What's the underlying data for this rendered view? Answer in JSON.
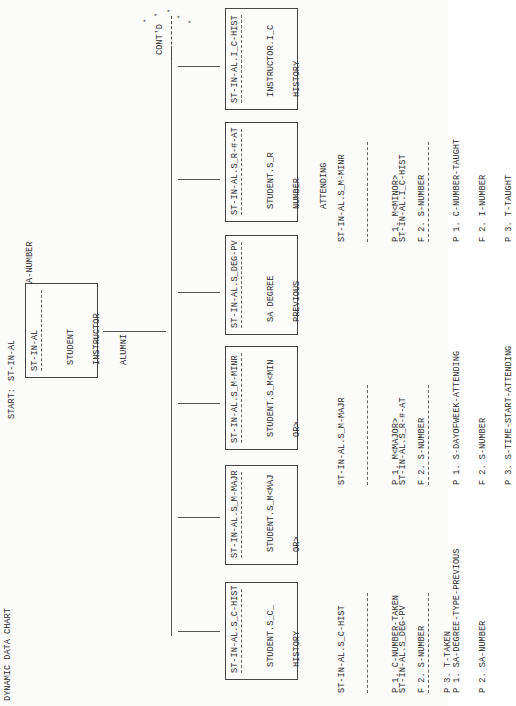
{
  "title": "DYNAMIC DATA CHART",
  "start": {
    "label": "START:",
    "value": "ST-IN-AL"
  },
  "primary_key": "P 1. SIA-NUMBER",
  "root_box": {
    "title": "ST-IN-AL",
    "lines": [
      "STUDENT",
      "INSTRUCTOR",
      "ALUMNI"
    ]
  },
  "continuation": {
    "label": "CONT'D",
    "stars": [
      "*",
      "*",
      "*",
      "*",
      "*"
    ]
  },
  "boxes": [
    {
      "title": "ST-IN-AL.S_C-HIST",
      "lines": [
        "STUDENT.S_C_",
        "HISTORY"
      ]
    },
    {
      "title": "ST-IN-AL.S_M-MAJR",
      "lines": [
        "STUDENT.S_M<MAJ",
        "OR>"
      ]
    },
    {
      "title": "ST-IN-AL.S_M-MINR",
      "lines": [
        "STUDENT.S_M<MIN",
        "OR>"
      ]
    },
    {
      "title": "ST-IN-AL.S_DEG-PV",
      "lines": [
        "SA DEGREE",
        "PREVIOUS"
      ]
    },
    {
      "title": "ST-IN-AL.S_R-#-AT",
      "lines": [
        "STUDENT.S_R",
        "NUMBER",
        "ATTENDING"
      ]
    },
    {
      "title": "ST-IN-AL.I_C-HIST",
      "lines": [
        "INSTRUCTOR.I_C",
        "HISTORY"
      ]
    }
  ],
  "lists": [
    {
      "title": "ST-IN-AL.S_C-HIST",
      "items": [
        "P 1. C-NUMBER-TAKEN",
        "F 2. S-NUMBER",
        "P 3. T-TAKEN"
      ]
    },
    {
      "title": "ST-IN-AL.S_DEG-PV",
      "items": [
        "P 1. SA-DEGREE-TYPE-PREVIOUS",
        "P 2. SA-NUMBER"
      ]
    },
    {
      "title": "ST-IN-AL.S_M-MAJR",
      "items": [
        "P 1. M<MAJOR>",
        "F 2. S-NUMBER"
      ]
    },
    {
      "title": "ST-IN-AL.S_R-#-AT",
      "items": [
        "P 1. S-DAYOFWEEK-ATTENDING",
        "F 2. S-NUMBER",
        "P 3. S-TIME-START-ATTENDING"
      ]
    },
    {
      "title": "ST-IN-AL.S_M-MINR",
      "items": [
        "P 1. M<MINOR>",
        "F 2. S-NUMBER"
      ]
    },
    {
      "title": "ST-IN-AL.I_C-HIST",
      "items": [
        "P 1. C-NUMBER-TAUGHT",
        "F 2. I-NUMBER",
        "P 3. T-TAUGHT"
      ]
    }
  ]
}
